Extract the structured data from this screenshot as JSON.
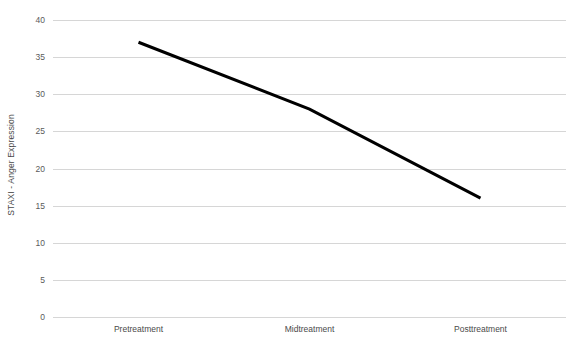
{
  "chart_data": {
    "type": "line",
    "title": "",
    "subtitle": "",
    "xlabel": "",
    "ylabel": "STAXI - Anger Expression",
    "categories": [
      "Pretreatment",
      "Midtreatment",
      "Posttreatment"
    ],
    "values": [
      37,
      28,
      16
    ],
    "series": [
      {
        "name": "STAXI - Anger Expression",
        "values": [
          37,
          28,
          16
        ]
      }
    ],
    "ylim": [
      0,
      40
    ],
    "ytick_values": [
      0,
      5,
      10,
      15,
      20,
      25,
      30,
      35,
      40
    ],
    "ytick_labels": [
      "0",
      "5",
      "10",
      "15",
      "20",
      "25",
      "30",
      "35",
      "40"
    ],
    "grid": "horizontal",
    "legend": "none",
    "markers": false,
    "annotations": [],
    "colors": {
      "series_line": "#000000",
      "gridline": "#d6d6d6",
      "tick_label": "#5a5a5a",
      "axis_title": "#4a4a4a",
      "background": "#ffffff"
    },
    "line_width_px": 3
  }
}
